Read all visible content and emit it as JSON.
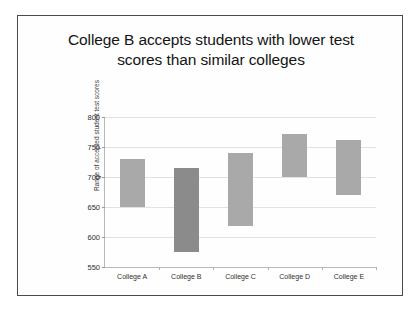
{
  "slide": {
    "title_line1": "College B accepts students with lower test",
    "title_line2": "scores than similar colleges",
    "frame_color": "#4a4a4a",
    "background_color": "#ffffff"
  },
  "chart_data": {
    "type": "bar",
    "subtype": "floating-range-bar",
    "title": "College B accepts students with lower test scores than similar colleges",
    "xlabel": "",
    "ylabel": "Range of accepted student test scores",
    "categories": [
      "College A",
      "College B",
      "College C",
      "College D",
      "College E"
    ],
    "series": [
      {
        "name": "Range low",
        "values": [
          650,
          575,
          618,
          700,
          670
        ]
      },
      {
        "name": "Range high",
        "values": [
          730,
          715,
          740,
          772,
          762
        ]
      }
    ],
    "bars": [
      {
        "category": "College A",
        "low": 650,
        "high": 730,
        "color": "#a9a9a9",
        "highlighted": false
      },
      {
        "category": "College B",
        "low": 575,
        "high": 715,
        "color": "#8b8b8b",
        "highlighted": true
      },
      {
        "category": "College C",
        "low": 618,
        "high": 740,
        "color": "#a9a9a9",
        "highlighted": false
      },
      {
        "category": "College D",
        "low": 700,
        "high": 772,
        "color": "#a9a9a9",
        "highlighted": false
      },
      {
        "category": "College E",
        "low": 670,
        "high": 762,
        "color": "#a9a9a9",
        "highlighted": false
      }
    ],
    "ylim": [
      550,
      800
    ],
    "yticks": [
      550,
      600,
      650,
      700,
      750,
      800
    ],
    "ytick_labels": [
      "550",
      "600",
      "650",
      "700",
      "750",
      "800"
    ],
    "grid": true,
    "grid_color": "#e2e2e2",
    "legend": null,
    "legend_position": "none",
    "bar_color": "#a9a9a9",
    "highlight_color": "#8b8b8b"
  }
}
